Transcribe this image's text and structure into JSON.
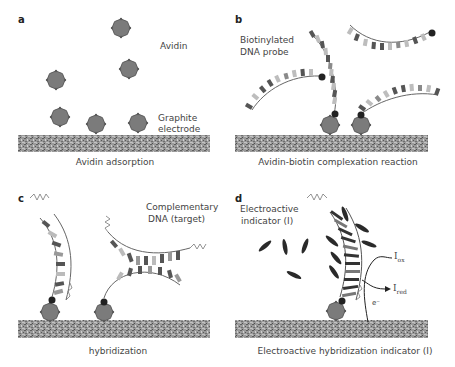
{
  "figure": {
    "panels": [
      {
        "id": "a",
        "label": "a",
        "annotations": [
          "Avidin",
          "Graphite",
          "electrode"
        ],
        "caption": "Avidin adsorption"
      },
      {
        "id": "b",
        "label": "b",
        "annotations": [
          "Biotinylated",
          "DNA probe"
        ],
        "caption": "Avidin-biotin complexation reaction"
      },
      {
        "id": "c",
        "label": "c",
        "annotations": [
          "Complementary",
          "DNA (target)"
        ],
        "caption": "hybridization"
      },
      {
        "id": "d",
        "label": "d",
        "annotations": [
          "Electroactive",
          "indicator (I)",
          "I",
          "ox",
          "I",
          "red",
          "e⁻"
        ],
        "caption": "Electroactive hybridization indicator (I)"
      }
    ],
    "colors": {
      "avidin": "#7a7a7a",
      "biotin": "#222222",
      "electrode_dark": "#6e6e6e",
      "electrode_light": "#b5b5b5",
      "base_dark": "#555555",
      "base_light": "#bdbdbd",
      "indicator": "#2a2a2a",
      "text": "#444444"
    }
  }
}
